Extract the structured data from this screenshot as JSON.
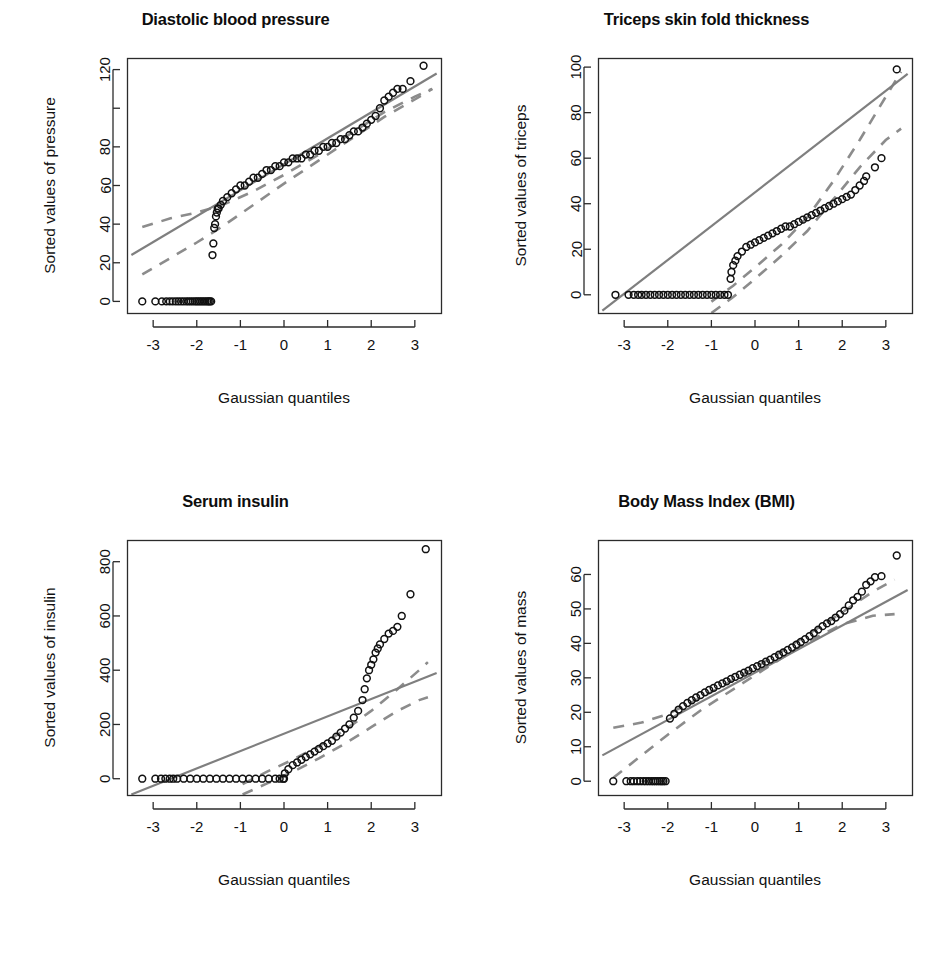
{
  "figure": {
    "layout": "2x2 grid of Q-Q plots",
    "background_color": "#ffffff",
    "point_color": "#111111",
    "line_color": "#7f7f7f",
    "band_color": "#8c8c8c"
  },
  "chart_data": [
    {
      "type": "scatter",
      "title": "Diastolic blood pressure",
      "xlabel": "Gaussian quantiles",
      "ylabel": "Sorted values of pressure",
      "xlim": [
        -3.6,
        3.6
      ],
      "ylim": [
        -6,
        126
      ],
      "xticks": [
        -3,
        -2,
        -1,
        0,
        1,
        2,
        3
      ],
      "xticklabels": [
        "-3",
        "-2",
        "-1",
        "0",
        "1",
        "2",
        "3"
      ],
      "yticks": [
        0,
        20,
        40,
        60,
        80,
        100,
        120
      ],
      "yticklabels": [
        "0",
        "20",
        "40",
        "60",
        "80",
        "",
        "120"
      ],
      "grid": false,
      "legend": "none",
      "reference_line": {
        "x": [
          -3.5,
          3.5
        ],
        "y": [
          24,
          118
        ]
      },
      "confidence_band_upper": {
        "x": [
          -3.25,
          -2.6,
          -2.0,
          -1.4,
          -0.7,
          0.0,
          0.8,
          1.6,
          2.3,
          3.0,
          3.4
        ],
        "y": [
          38.5,
          43.0,
          46.0,
          50.0,
          57.0,
          65.5,
          76.0,
          88.0,
          98.0,
          106.0,
          110.0
        ]
      },
      "confidence_band_lower": {
        "x": [
          -3.25,
          -2.6,
          -2.0,
          -1.4,
          -0.7,
          0.0,
          0.8,
          1.6,
          2.3,
          3.0,
          3.4
        ],
        "y": [
          14.0,
          22.5,
          30.5,
          39.0,
          50.0,
          61.0,
          73.0,
          85.0,
          95.5,
          104.5,
          110.0
        ]
      },
      "x": [
        -3.25,
        -2.95,
        -2.8,
        -2.7,
        -2.62,
        -2.55,
        -2.48,
        -2.42,
        -2.36,
        -2.3,
        -2.24,
        -2.19,
        -2.14,
        -2.09,
        -2.04,
        -2.0,
        -1.96,
        -1.92,
        -1.88,
        -1.84,
        -1.8,
        -1.76,
        -1.73,
        -1.7,
        -1.67,
        -1.64,
        -1.62,
        -1.6,
        -1.58,
        -1.56,
        -1.54,
        -1.52,
        -1.5,
        -1.45,
        -1.4,
        -1.3,
        -1.2,
        -1.1,
        -1.0,
        -0.9,
        -0.8,
        -0.7,
        -0.6,
        -0.5,
        -0.4,
        -0.3,
        -0.2,
        -0.1,
        0.0,
        0.1,
        0.2,
        0.3,
        0.4,
        0.5,
        0.6,
        0.7,
        0.8,
        0.9,
        1.0,
        1.1,
        1.2,
        1.3,
        1.4,
        1.5,
        1.6,
        1.7,
        1.8,
        1.9,
        2.0,
        2.1,
        2.2,
        2.3,
        2.4,
        2.5,
        2.6,
        2.72,
        2.9,
        3.2
      ],
      "y": [
        0,
        0,
        0,
        0,
        0,
        0,
        0,
        0,
        0,
        0,
        0,
        0,
        0,
        0,
        0,
        0,
        0,
        0,
        0,
        0,
        0,
        0,
        0,
        0,
        0,
        24,
        30,
        38,
        40,
        44,
        46,
        48,
        48,
        50,
        52,
        54,
        56,
        58,
        60,
        60,
        62,
        64,
        64,
        66,
        68,
        68,
        70,
        70,
        72,
        72,
        74,
        74,
        74,
        76,
        76,
        78,
        78,
        80,
        80,
        82,
        82,
        84,
        84,
        86,
        88,
        88,
        90,
        92,
        94,
        96,
        100,
        104,
        106,
        108,
        110,
        110,
        114,
        122
      ]
    },
    {
      "type": "scatter",
      "title": "Triceps skin fold thickness",
      "xlabel": "Gaussian quantiles",
      "ylabel": "Sorted values of triceps",
      "xlim": [
        -3.6,
        3.6
      ],
      "ylim": [
        -8,
        104
      ],
      "xticks": [
        -3,
        -2,
        -1,
        0,
        1,
        2,
        3
      ],
      "xticklabels": [
        "-3",
        "-2",
        "-1",
        "0",
        "1",
        "2",
        "3"
      ],
      "yticks": [
        0,
        20,
        40,
        60,
        80,
        100
      ],
      "yticklabels": [
        "0",
        "20",
        "40",
        "60",
        "80",
        "100"
      ],
      "grid": false,
      "legend": "none",
      "reference_line": {
        "x": [
          -3.5,
          3.5
        ],
        "y": [
          -7,
          97
        ]
      },
      "confidence_band_upper": {
        "x": [
          -1.0,
          -0.5,
          0.0,
          0.6,
          1.2,
          1.8,
          2.4,
          3.0,
          3.35
        ],
        "y": [
          -3.0,
          4.0,
          12.0,
          22.0,
          34.0,
          50.0,
          68.0,
          87.0,
          98.0
        ]
      },
      "confidence_band_lower": {
        "x": [
          -1.0,
          -0.5,
          0.0,
          0.6,
          1.2,
          1.8,
          2.4,
          3.0,
          3.35
        ],
        "y": [
          -8.0,
          -1.0,
          7.0,
          17.0,
          28.0,
          42.0,
          56.0,
          68.0,
          73.0
        ]
      },
      "x": [
        -3.2,
        -2.9,
        -2.78,
        -2.68,
        -2.6,
        -2.5,
        -2.4,
        -2.3,
        -2.2,
        -2.1,
        -2.0,
        -1.9,
        -1.8,
        -1.7,
        -1.6,
        -1.5,
        -1.4,
        -1.3,
        -1.2,
        -1.1,
        -1.0,
        -0.9,
        -0.8,
        -0.7,
        -0.62,
        -0.56,
        -0.54,
        -0.5,
        -0.45,
        -0.4,
        -0.3,
        -0.2,
        -0.1,
        0.0,
        0.1,
        0.2,
        0.3,
        0.4,
        0.5,
        0.6,
        0.7,
        0.8,
        0.9,
        1.0,
        1.1,
        1.2,
        1.3,
        1.4,
        1.5,
        1.6,
        1.7,
        1.8,
        1.9,
        2.0,
        2.1,
        2.2,
        2.3,
        2.4,
        2.5,
        2.55,
        2.75,
        2.9,
        3.25
      ],
      "y": [
        0,
        0,
        0,
        0,
        0,
        0,
        0,
        0,
        0,
        0,
        0,
        0,
        0,
        0,
        0,
        0,
        0,
        0,
        0,
        0,
        0,
        0,
        0,
        0,
        0,
        7,
        10,
        13,
        15,
        17,
        19,
        21,
        22,
        23,
        24,
        25,
        26,
        27,
        28,
        29,
        30,
        30,
        31,
        32,
        33,
        34,
        35,
        36,
        37,
        38,
        39,
        40,
        41,
        42,
        43,
        44,
        46,
        48,
        50,
        52,
        56,
        60,
        99
      ]
    },
    {
      "type": "scatter",
      "title": "Serum insulin",
      "xlabel": "Gaussian quantiles",
      "ylabel": "Sorted values of insulin",
      "xlim": [
        -3.6,
        3.6
      ],
      "ylim": [
        -60,
        880
      ],
      "xticks": [
        -3,
        -2,
        -1,
        0,
        1,
        2,
        3
      ],
      "xticklabels": [
        "-3",
        "-2",
        "-1",
        "0",
        "1",
        "2",
        "3"
      ],
      "yticks": [
        0,
        200,
        400,
        600,
        800
      ],
      "yticklabels": [
        "0",
        "200",
        "400",
        "600",
        "800"
      ],
      "grid": false,
      "legend": "none",
      "reference_line": {
        "x": [
          -3.5,
          3.5
        ],
        "y": [
          -58,
          390
        ]
      },
      "confidence_band_upper": {
        "x": [
          -0.95,
          -0.4,
          0.2,
          0.8,
          1.4,
          2.0,
          2.6,
          3.1,
          3.3
        ],
        "y": [
          -20.0,
          25.0,
          70.0,
          120.0,
          180.0,
          250.0,
          330.0,
          400.0,
          430.0
        ]
      },
      "confidence_band_lower": {
        "x": [
          -0.95,
          -0.4,
          0.2,
          0.8,
          1.4,
          2.0,
          2.6,
          3.1,
          3.3
        ],
        "y": [
          -58.0,
          -18.0,
          25.0,
          75.0,
          130.0,
          190.0,
          250.0,
          290.0,
          300.0
        ]
      },
      "x": [
        -3.25,
        -2.95,
        -2.82,
        -2.72,
        -2.62,
        -2.54,
        -2.45,
        -2.3,
        -2.15,
        -2.0,
        -1.85,
        -1.7,
        -1.55,
        -1.4,
        -1.25,
        -1.1,
        -0.95,
        -0.8,
        -0.65,
        -0.5,
        -0.35,
        -0.2,
        -0.1,
        -0.02,
        0.0,
        0.02,
        0.1,
        0.2,
        0.3,
        0.4,
        0.5,
        0.6,
        0.7,
        0.8,
        0.9,
        1.0,
        1.1,
        1.2,
        1.3,
        1.4,
        1.5,
        1.6,
        1.7,
        1.8,
        1.85,
        1.9,
        1.95,
        2.0,
        2.05,
        2.1,
        2.15,
        2.2,
        2.3,
        2.4,
        2.5,
        2.6,
        2.7,
        2.9,
        3.25
      ],
      "y": [
        0,
        0,
        0,
        0,
        0,
        0,
        0,
        0,
        0,
        0,
        0,
        0,
        0,
        0,
        0,
        0,
        0,
        0,
        0,
        0,
        0,
        0,
        0,
        0,
        0,
        20,
        35,
        50,
        60,
        70,
        80,
        90,
        100,
        110,
        120,
        130,
        140,
        155,
        170,
        185,
        200,
        225,
        250,
        290,
        330,
        370,
        400,
        420,
        440,
        465,
        480,
        495,
        515,
        535,
        545,
        560,
        600,
        680,
        846
      ]
    },
    {
      "type": "scatter",
      "title": "Body Mass Index (BMI)",
      "xlabel": "Gaussian quantiles",
      "ylabel": "Sorted values of mass",
      "xlim": [
        -3.6,
        3.6
      ],
      "ylim": [
        -4,
        70
      ],
      "xticks": [
        -3,
        -2,
        -1,
        0,
        1,
        2,
        3
      ],
      "xticklabels": [
        "-3",
        "-2",
        "-1",
        "0",
        "1",
        "2",
        "3"
      ],
      "yticks": [
        0,
        10,
        20,
        30,
        40,
        50,
        60
      ],
      "yticklabels": [
        "0",
        "10",
        "20",
        "30",
        "40",
        "50",
        "60"
      ],
      "grid": false,
      "legend": "none",
      "reference_line": {
        "x": [
          -3.5,
          3.5
        ],
        "y": [
          7.5,
          55.5
        ]
      },
      "confidence_band_upper": {
        "x": [
          -3.25,
          -2.6,
          -2.0,
          -1.2,
          -0.4,
          0.4,
          1.2,
          2.0,
          2.7,
          3.2
        ],
        "y": [
          15.5,
          17.0,
          19.5,
          24.5,
          30.0,
          36.0,
          42.5,
          49.0,
          55.0,
          58.5
        ]
      },
      "confidence_band_lower": {
        "x": [
          -3.25,
          -2.6,
          -2.0,
          -1.2,
          -0.4,
          0.4,
          1.2,
          2.0,
          2.7,
          3.2
        ],
        "y": [
          1.0,
          7.5,
          13.5,
          21.0,
          27.5,
          34.0,
          40.5,
          45.5,
          48.0,
          48.5
        ]
      },
      "x": [
        -3.25,
        -2.95,
        -2.85,
        -2.78,
        -2.7,
        -2.63,
        -2.56,
        -2.5,
        -2.44,
        -2.38,
        -2.33,
        -2.28,
        -2.23,
        -2.18,
        -2.14,
        -2.1,
        -2.05,
        -1.95,
        -1.85,
        -1.75,
        -1.65,
        -1.55,
        -1.45,
        -1.35,
        -1.25,
        -1.15,
        -1.05,
        -0.95,
        -0.85,
        -0.75,
        -0.65,
        -0.55,
        -0.45,
        -0.35,
        -0.25,
        -0.15,
        -0.05,
        0.05,
        0.15,
        0.25,
        0.35,
        0.45,
        0.55,
        0.65,
        0.75,
        0.85,
        0.95,
        1.05,
        1.15,
        1.25,
        1.35,
        1.45,
        1.55,
        1.65,
        1.75,
        1.85,
        1.95,
        2.05,
        2.15,
        2.25,
        2.35,
        2.45,
        2.55,
        2.65,
        2.75,
        2.9,
        3.25
      ],
      "y": [
        0,
        0,
        0,
        0,
        0,
        0,
        0,
        0,
        0,
        0,
        0,
        0,
        0,
        0,
        0,
        0,
        0,
        18.2,
        19.5,
        20.8,
        21.8,
        22.7,
        23.5,
        24.3,
        25.0,
        25.8,
        26.5,
        27.1,
        27.8,
        28.4,
        29.0,
        29.7,
        30.3,
        30.9,
        31.5,
        32.1,
        32.8,
        33.4,
        34.0,
        34.7,
        35.3,
        36.0,
        36.7,
        37.4,
        38.1,
        38.8,
        39.6,
        40.4,
        41.2,
        42.1,
        43.0,
        44.0,
        45.0,
        45.8,
        46.5,
        47.5,
        48.5,
        49.5,
        51.0,
        52.5,
        53.5,
        55.0,
        57.0,
        58.0,
        59.2,
        59.5,
        65.5
      ]
    }
  ]
}
